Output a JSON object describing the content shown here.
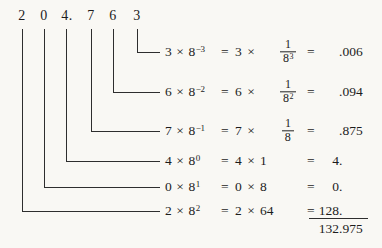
{
  "octal": {
    "digits": [
      "2",
      "0",
      "4.",
      "7",
      "6",
      "3"
    ]
  },
  "rows": [
    {
      "digit": "3",
      "times": "×",
      "base": "8",
      "exp": "−3",
      "eq1": "=",
      "mult": "3 ×",
      "frac_num": "1",
      "frac_den": "8",
      "frac_exp": "3",
      "eq2": "=",
      "result_int": "",
      "result_frac": ".006"
    },
    {
      "digit": "6",
      "times": "×",
      "base": "8",
      "exp": "−2",
      "eq1": "=",
      "mult": "6 ×",
      "frac_num": "1",
      "frac_den": "8",
      "frac_exp": "2",
      "eq2": "=",
      "result_int": "",
      "result_frac": ".094"
    },
    {
      "digit": "7",
      "times": "×",
      "base": "8",
      "exp": "−1",
      "eq1": "=",
      "mult": "7 ×",
      "frac_num": "1",
      "frac_den": "8",
      "frac_exp": "",
      "eq2": "=",
      "result_int": "",
      "result_frac": ".875"
    },
    {
      "digit": "4",
      "times": "×",
      "base": "8",
      "exp": "0",
      "eq1": "=",
      "expansion": "4 × 1",
      "eq2": "=",
      "result_int": "4",
      "result_frac": "."
    },
    {
      "digit": "0",
      "times": "×",
      "base": "8",
      "exp": "1",
      "eq1": "=",
      "expansion": "0 × 8",
      "eq2": "=",
      "result_int": "0",
      "result_frac": "."
    },
    {
      "digit": "2",
      "times": "×",
      "base": "8",
      "exp": "2",
      "eq1": "=",
      "expansion": "2 × 64",
      "eq2": "=",
      "result_int": "128",
      "result_frac": "."
    }
  ],
  "total": {
    "int": "132",
    "frac": ".975"
  }
}
